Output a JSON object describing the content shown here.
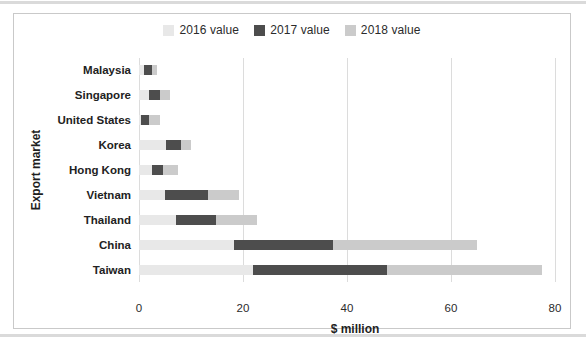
{
  "colors": {
    "panel_border": "#c9c9c9",
    "gridline": "#dcdcdc",
    "text": "#212121",
    "series_2016": "#e8e8e8",
    "series_2017": "#4d4d4d",
    "series_2018": "#cbcbcb"
  },
  "chart_data": {
    "type": "bar",
    "orientation": "horizontal",
    "stacked": true,
    "title": "",
    "xlabel": "$ million",
    "ylabel": "Export market",
    "xlim": [
      0,
      83
    ],
    "xticks": [
      0,
      20,
      40,
      60,
      80
    ],
    "grid": true,
    "legend_position": "top",
    "categories": [
      "Malaysia",
      "Singapore",
      "United States",
      "Korea",
      "Hong Kong",
      "Vietnam",
      "Thailand",
      "China",
      "Taiwan"
    ],
    "series": [
      {
        "name": "2016 value",
        "color": "#e8e8e8",
        "values": [
          1.0,
          2.0,
          0.3,
          5.2,
          2.5,
          5.0,
          7.2,
          18.3,
          22.0
        ]
      },
      {
        "name": "2017 value",
        "color": "#4d4d4d",
        "values": [
          1.5,
          2.0,
          1.7,
          2.8,
          2.2,
          8.2,
          7.6,
          19.0,
          25.7
        ]
      },
      {
        "name": "2018 value",
        "color": "#cbcbcb",
        "values": [
          1.0,
          1.9,
          2.0,
          2.1,
          2.8,
          6.0,
          7.8,
          27.7,
          29.8
        ]
      }
    ]
  }
}
